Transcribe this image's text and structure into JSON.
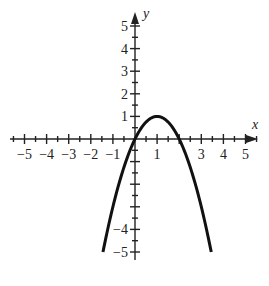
{
  "chart_data": {
    "type": "line",
    "title": "",
    "xlabel": "x",
    "ylabel": "y",
    "xlim": [
      -5,
      5
    ],
    "ylim": [
      -5,
      5
    ],
    "grid": false,
    "x_tick_labels": [
      "-5",
      "-4",
      "-3",
      "-2",
      "-1",
      "1",
      "3",
      "4",
      "5"
    ],
    "y_tick_labels": [
      "5",
      "4",
      "3",
      "2",
      "1",
      "-4",
      "-5"
    ],
    "series": [
      {
        "name": "y = -x^2 + 2x",
        "equation": "y = -x^2 + 2x",
        "vertex": [
          1,
          1
        ],
        "x_intercepts": [
          0,
          2
        ],
        "x": [
          -1.45,
          -1,
          -0.5,
          0,
          0.5,
          1,
          1.5,
          2,
          2.5,
          3,
          3.45
        ],
        "y": [
          -5.0,
          -3,
          -1.25,
          0,
          0.75,
          1,
          0.75,
          0,
          -1.25,
          -3,
          -5.0
        ]
      }
    ],
    "color": "#111111"
  },
  "labels": {
    "x_axis": "x",
    "y_axis": "y"
  }
}
